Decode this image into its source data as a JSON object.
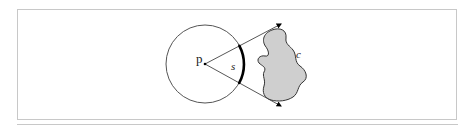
{
  "diagram": {
    "labels": {
      "point": "p",
      "arc": "s",
      "region": "c"
    },
    "colors": {
      "frame": "#c8c8c8",
      "circle_stroke": "#555555",
      "line_stroke": "#444444",
      "arc_stroke": "#000000",
      "blob_fill": "#cfcfcf",
      "blob_stroke": "#333333",
      "text": "#222222"
    },
    "geometry": {
      "circle": {
        "cx": 205,
        "cy": 64,
        "r": 39
      },
      "point_p": {
        "x": 205,
        "y": 64
      },
      "ray_upper_end": {
        "x": 281,
        "y": 24
      },
      "ray_lower_end": {
        "x": 281,
        "y": 106
      }
    }
  }
}
